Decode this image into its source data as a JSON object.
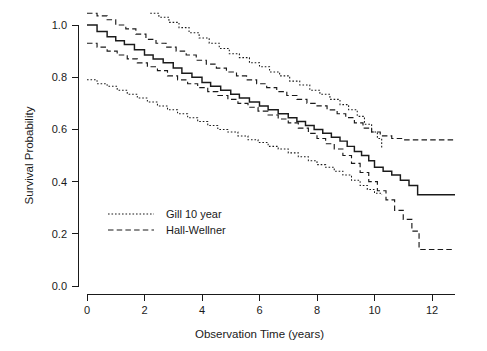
{
  "chart_data": {
    "type": "line",
    "title": "",
    "xlabel": "Observation Time (years)",
    "ylabel": "Survival Probability",
    "xlim": [
      0,
      13.2
    ],
    "ylim": [
      0.0,
      1.06
    ],
    "grid": false,
    "legend_position": "inside-left-lower",
    "xticks": [
      "0",
      "2",
      "4",
      "6",
      "8",
      "10",
      "12"
    ],
    "xtick_values": [
      0,
      2,
      4,
      6,
      8,
      10,
      12
    ],
    "yticks": [
      "0.0",
      "0.2",
      "0.4",
      "0.6",
      "0.8",
      "1.0"
    ],
    "ytick_values": [
      0.0,
      0.2,
      0.4,
      0.6,
      0.8,
      1.0
    ],
    "legend": [
      {
        "label": "Gill 10 year",
        "style": "dotted"
      },
      {
        "label": "Hall-Wellner",
        "style": "dashed"
      }
    ],
    "series": [
      {
        "name": "Kaplan-Meier estimate",
        "style": "solid",
        "step": true,
        "x": [
          0.0,
          0.35,
          0.7,
          1.0,
          1.3,
          1.65,
          2.0,
          2.3,
          2.65,
          3.0,
          3.3,
          3.65,
          4.0,
          4.3,
          4.65,
          5.0,
          5.3,
          5.65,
          6.0,
          6.3,
          6.65,
          7.0,
          7.3,
          7.6,
          7.9,
          8.2,
          8.5,
          8.8,
          9.05,
          9.3,
          9.55,
          9.8,
          10.0,
          10.3,
          10.6,
          10.9,
          11.2,
          11.5,
          12.0,
          12.8
        ],
        "y": [
          1.0,
          0.975,
          0.955,
          0.94,
          0.925,
          0.905,
          0.885,
          0.87,
          0.855,
          0.835,
          0.815,
          0.8,
          0.78,
          0.765,
          0.75,
          0.735,
          0.72,
          0.705,
          0.69,
          0.675,
          0.66,
          0.645,
          0.63,
          0.615,
          0.6,
          0.585,
          0.57,
          0.555,
          0.535,
          0.515,
          0.5,
          0.48,
          0.455,
          0.44,
          0.425,
          0.405,
          0.385,
          0.35,
          0.35,
          0.35
        ]
      },
      {
        "name": "Hall-Wellner upper band",
        "style": "dashed",
        "step": true,
        "x": [
          0.0,
          0.35,
          0.7,
          1.0,
          1.35,
          1.7,
          2.05,
          2.4,
          2.75,
          3.1,
          3.45,
          3.8,
          4.15,
          4.5,
          4.85,
          5.2,
          5.55,
          5.9,
          6.25,
          6.6,
          6.95,
          7.3,
          7.65,
          8.0,
          8.35,
          8.7,
          9.0,
          9.3,
          9.6,
          9.9,
          10.2,
          10.6,
          11.0,
          11.5,
          12.0,
          12.8
        ],
        "y": [
          1.045,
          1.035,
          1.02,
          1.0,
          0.985,
          0.965,
          0.945,
          0.93,
          0.915,
          0.9,
          0.885,
          0.865,
          0.85,
          0.835,
          0.82,
          0.805,
          0.79,
          0.775,
          0.76,
          0.745,
          0.73,
          0.715,
          0.7,
          0.69,
          0.675,
          0.66,
          0.645,
          0.625,
          0.605,
          0.59,
          0.575,
          0.565,
          0.56,
          0.56,
          0.56,
          0.56
        ]
      },
      {
        "name": "Hall-Wellner lower band",
        "style": "dashed",
        "step": true,
        "x": [
          0.0,
          0.35,
          0.7,
          1.05,
          1.4,
          1.75,
          2.1,
          2.45,
          2.8,
          3.15,
          3.5,
          3.85,
          4.2,
          4.55,
          4.9,
          5.25,
          5.6,
          5.95,
          6.3,
          6.65,
          7.0,
          7.35,
          7.7,
          8.0,
          8.3,
          8.6,
          8.9,
          9.2,
          9.5,
          9.8,
          10.1,
          10.4,
          10.7,
          11.0,
          11.3,
          11.55,
          11.8,
          12.3,
          12.8
        ],
        "y": [
          0.93,
          0.915,
          0.9,
          0.885,
          0.87,
          0.855,
          0.84,
          0.825,
          0.805,
          0.79,
          0.775,
          0.76,
          0.745,
          0.73,
          0.715,
          0.7,
          0.685,
          0.67,
          0.655,
          0.64,
          0.625,
          0.605,
          0.585,
          0.565,
          0.545,
          0.525,
          0.5,
          0.47,
          0.435,
          0.4,
          0.365,
          0.33,
          0.29,
          0.255,
          0.21,
          0.14,
          0.14,
          0.14,
          0.14
        ]
      },
      {
        "name": "Gill 10 year upper band",
        "style": "dotted",
        "step": true,
        "x": [
          2.2,
          2.5,
          2.85,
          3.2,
          3.55,
          3.9,
          4.25,
          4.6,
          4.95,
          5.3,
          5.65,
          6.0,
          6.35,
          6.7,
          7.05,
          7.4,
          7.75,
          8.1,
          8.45,
          8.8,
          9.1,
          9.4,
          9.65,
          9.9,
          10.1,
          10.25
        ],
        "y": [
          1.045,
          1.03,
          1.01,
          0.99,
          0.97,
          0.95,
          0.93,
          0.91,
          0.89,
          0.875,
          0.855,
          0.84,
          0.82,
          0.805,
          0.785,
          0.77,
          0.75,
          0.735,
          0.715,
          0.695,
          0.675,
          0.65,
          0.62,
          0.59,
          0.565,
          0.53
        ]
      },
      {
        "name": "Gill 10 year lower band",
        "style": "dotted",
        "step": true,
        "x": [
          0.0,
          0.35,
          0.7,
          1.05,
          1.4,
          1.75,
          2.1,
          2.45,
          2.8,
          3.15,
          3.5,
          3.85,
          4.2,
          4.55,
          4.9,
          5.25,
          5.6,
          5.95,
          6.3,
          6.65,
          7.0,
          7.35,
          7.7,
          8.0,
          8.3,
          8.6,
          8.9,
          9.2,
          9.5,
          9.75,
          10.0,
          10.25
        ],
        "y": [
          0.79,
          0.775,
          0.765,
          0.75,
          0.735,
          0.72,
          0.705,
          0.69,
          0.675,
          0.66,
          0.645,
          0.63,
          0.615,
          0.6,
          0.59,
          0.575,
          0.56,
          0.55,
          0.535,
          0.525,
          0.51,
          0.495,
          0.48,
          0.465,
          0.455,
          0.44,
          0.425,
          0.405,
          0.385,
          0.37,
          0.355,
          0.35
        ]
      }
    ]
  },
  "colors": {
    "ink": "#1a1a1a",
    "background": "#ffffff"
  }
}
